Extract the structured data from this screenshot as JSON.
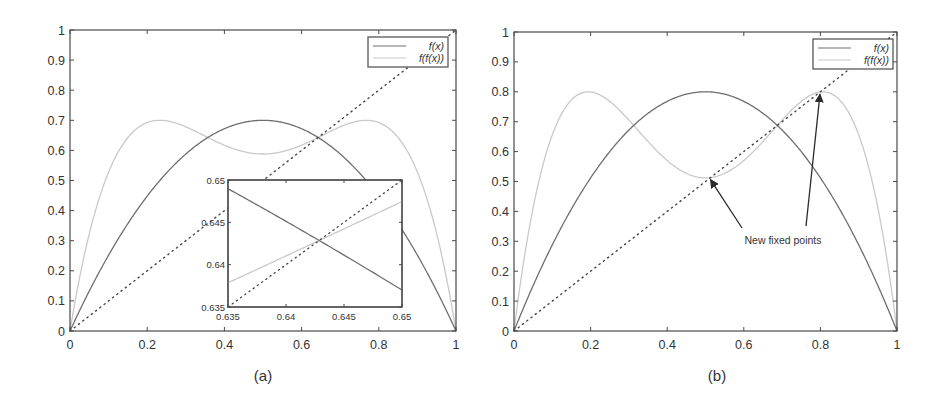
{
  "figure": {
    "panels": [
      {
        "id": "a",
        "label": "(a)"
      },
      {
        "id": "b",
        "label": "(b)"
      }
    ]
  },
  "colors": {
    "fx": "#6e6e6e",
    "ffx": "#c9c9c9",
    "diagonal": "#444444",
    "axes": "#4a4a4a",
    "text": "#333333"
  },
  "chart_data": [
    {
      "panel": "(a)",
      "type": "line",
      "title": "",
      "xlabel": "",
      "ylabel": "",
      "xlim": [
        0,
        1
      ],
      "ylim": [
        0,
        1
      ],
      "grid": false,
      "legend_position": "upper right",
      "x_ticks": [
        "0",
        "0.2",
        "0.4",
        "0.6",
        "0.8",
        "1"
      ],
      "y_ticks": [
        "0",
        "0.1",
        "0.2",
        "0.3",
        "0.4",
        "0.5",
        "0.6",
        "0.7",
        "0.8",
        "0.9",
        "1"
      ],
      "legend": [
        "f(x)",
        "f(f(x))"
      ],
      "parameter_r": 2.8,
      "series": [
        {
          "name": "f(x)",
          "style": "solid dark gray",
          "formula": "r*x*(1-x)",
          "peak": [
            0.5,
            0.7
          ],
          "x": [
            0,
            0.1,
            0.2,
            0.3,
            0.4,
            0.5,
            0.6,
            0.7,
            0.8,
            0.9,
            1
          ],
          "y": [
            0,
            0.252,
            0.448,
            0.588,
            0.672,
            0.7,
            0.672,
            0.588,
            0.448,
            0.252,
            0
          ]
        },
        {
          "name": "f(f(x))",
          "style": "solid light gray",
          "formula": "f(f(x))",
          "peaks": [
            [
              0.23,
              0.7
            ],
            [
              0.77,
              0.7
            ]
          ],
          "min": [
            0.5,
            0.588
          ],
          "x": [
            0,
            0.1,
            0.2,
            0.3,
            0.4,
            0.5,
            0.6,
            0.7,
            0.8,
            0.9,
            1
          ],
          "y": [
            0,
            0.528,
            0.692,
            0.678,
            0.617,
            0.588,
            0.617,
            0.678,
            0.692,
            0.528,
            0
          ]
        },
        {
          "name": "y = x",
          "style": "dotted",
          "x": [
            0,
            1
          ],
          "y": [
            0,
            1
          ]
        }
      ],
      "inset": {
        "xlim": [
          0.635,
          0.65
        ],
        "ylim": [
          0.635,
          0.65
        ],
        "x_ticks": [
          "0.635",
          "0.64",
          "0.645",
          "0.65"
        ],
        "y_ticks": [
          "0.635",
          "0.64",
          "0.645",
          "0.65"
        ],
        "fixed_point": [
          0.6429,
          0.6429
        ],
        "series": [
          {
            "name": "f(x)",
            "x": [
              0.635,
              0.65
            ],
            "y": [
              0.6489,
              0.637
            ]
          },
          {
            "name": "f(f(x))",
            "x": [
              0.635,
              0.65
            ],
            "y": [
              0.6374,
              0.6476
            ]
          },
          {
            "name": "y = x",
            "x": [
              0.635,
              0.65
            ],
            "y": [
              0.635,
              0.65
            ]
          }
        ]
      }
    },
    {
      "panel": "(b)",
      "type": "line",
      "title": "",
      "xlabel": "",
      "ylabel": "",
      "xlim": [
        0,
        1
      ],
      "ylim": [
        0,
        1
      ],
      "grid": false,
      "legend_position": "upper right",
      "x_ticks": [
        "0",
        "0.2",
        "0.4",
        "0.6",
        "0.8",
        "1"
      ],
      "y_ticks": [
        "0",
        "0.1",
        "0.2",
        "0.3",
        "0.4",
        "0.5",
        "0.6",
        "0.7",
        "0.8",
        "0.9",
        "1"
      ],
      "legend": [
        "f(x)",
        "f(f(x))"
      ],
      "parameter_r": 3.2,
      "series": [
        {
          "name": "f(x)",
          "style": "solid dark gray",
          "formula": "r*x*(1-x)",
          "peak": [
            0.5,
            0.8
          ],
          "x": [
            0,
            0.1,
            0.2,
            0.3,
            0.4,
            0.5,
            0.6,
            0.7,
            0.8,
            0.9,
            1
          ],
          "y": [
            0,
            0.288,
            0.512,
            0.672,
            0.768,
            0.8,
            0.768,
            0.672,
            0.512,
            0.288,
            0
          ]
        },
        {
          "name": "f(f(x))",
          "style": "solid light gray",
          "formula": "f(f(x))",
          "peaks": [
            [
              0.19,
              0.8
            ],
            [
              0.81,
              0.8
            ]
          ],
          "min": [
            0.5,
            0.512
          ],
          "x": [
            0,
            0.1,
            0.2,
            0.3,
            0.4,
            0.5,
            0.6,
            0.7,
            0.8,
            0.9,
            1
          ],
          "y": [
            0,
            0.656,
            0.8,
            0.705,
            0.57,
            0.512,
            0.57,
            0.705,
            0.8,
            0.656,
            0
          ]
        },
        {
          "name": "y = x",
          "style": "dotted",
          "x": [
            0,
            1
          ],
          "y": [
            0,
            1
          ]
        }
      ],
      "annotations": [
        {
          "text": "New fixed points",
          "position": [
            0.62,
            0.3
          ],
          "arrows_to": [
            [
              0.513,
              0.513
            ],
            [
              0.799,
              0.799
            ]
          ]
        }
      ]
    }
  ]
}
